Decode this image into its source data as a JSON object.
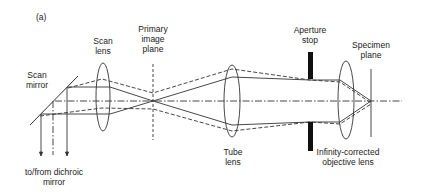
{
  "figure": {
    "panel_label": "(a)",
    "labels": {
      "scan_mirror": "Scan\nmirror",
      "scan_lens": "Scan\nlens",
      "primary_image_plane": "Primary\nimage\nplane",
      "aperture_stop": "Aperture\nstop",
      "specimen_plane": "Specimen\nplane",
      "tube_lens": "Tube\nlens",
      "objective_lens": "Infinity-corrected\nobjective lens",
      "dichroic": "to/from dichroic\nmirror"
    },
    "colors": {
      "line": "#333333",
      "stop": "#111111",
      "background": "#ffffff"
    }
  }
}
